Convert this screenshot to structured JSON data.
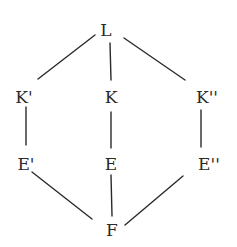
{
  "diagram": {
    "type": "lattice",
    "line_color": "#2a2a2a",
    "nodes": [
      {
        "id": "L",
        "label": "L",
        "x": 106,
        "y": 30
      },
      {
        "id": "K1",
        "label": "K'",
        "x": 24,
        "y": 97
      },
      {
        "id": "K",
        "label": "K",
        "x": 111,
        "y": 97
      },
      {
        "id": "K2",
        "label": "K''",
        "x": 207,
        "y": 97
      },
      {
        "id": "E1",
        "label": "E'",
        "x": 26,
        "y": 164
      },
      {
        "id": "E",
        "label": "E",
        "x": 111,
        "y": 164
      },
      {
        "id": "E2",
        "label": "E''",
        "x": 209,
        "y": 164
      },
      {
        "id": "F",
        "label": "F",
        "x": 112,
        "y": 230
      }
    ],
    "edges": [
      {
        "from": "L",
        "to": "K1",
        "x1": 95,
        "y1": 35,
        "x2": 38,
        "y2": 79
      },
      {
        "from": "L",
        "to": "K",
        "x1": 110,
        "y1": 43,
        "x2": 111,
        "y2": 80
      },
      {
        "from": "L",
        "to": "K2",
        "x1": 124,
        "y1": 38,
        "x2": 185,
        "y2": 80
      },
      {
        "from": "K1",
        "to": "E1",
        "x1": 26,
        "y1": 107,
        "x2": 26,
        "y2": 145
      },
      {
        "from": "K",
        "to": "E",
        "x1": 111,
        "y1": 112,
        "x2": 111,
        "y2": 148
      },
      {
        "from": "K2",
        "to": "E2",
        "x1": 201,
        "y1": 110,
        "x2": 201,
        "y2": 147
      },
      {
        "from": "E1",
        "to": "F",
        "x1": 32,
        "y1": 172,
        "x2": 92,
        "y2": 219
      },
      {
        "from": "E",
        "to": "F",
        "x1": 111,
        "y1": 175,
        "x2": 112,
        "y2": 216
      },
      {
        "from": "E2",
        "to": "F",
        "x1": 183,
        "y1": 176,
        "x2": 125,
        "y2": 225
      }
    ]
  }
}
